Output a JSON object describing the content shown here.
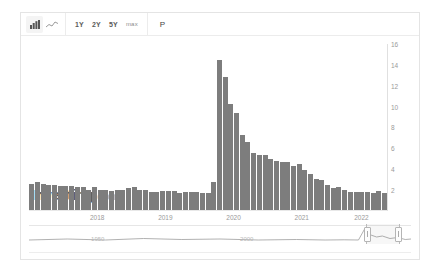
{
  "toolbar": {
    "chart_type_icons": [
      {
        "name": "bar-chart-icon",
        "label": "Bar chart",
        "active": true
      },
      {
        "name": "line-chart-icon",
        "label": "Line chart",
        "active": false
      }
    ],
    "ranges": [
      {
        "label": "1Y"
      },
      {
        "label": "2Y"
      },
      {
        "label": "5Y"
      },
      {
        "label": "max"
      }
    ],
    "print_label": "P"
  },
  "chart_data": {
    "type": "bar",
    "title": "",
    "xlabel": "",
    "ylabel": "",
    "ylim": [
      2,
      16
    ],
    "grid": false,
    "legend": null,
    "bar_color": "#7d7d7d",
    "ytick_labels": [
      "16",
      "14",
      "12",
      "10",
      "8",
      "6",
      "4",
      "2"
    ],
    "ytick_values": [
      16,
      14,
      12,
      10,
      8,
      6,
      4,
      2
    ],
    "xtick_labels": [
      "2018",
      "2019",
      "2020",
      "2021",
      "2022"
    ],
    "xtick_values": [
      2018,
      2019,
      2020,
      2021,
      2022
    ],
    "categories": [
      "2017-07",
      "2017-08",
      "2017-09",
      "2017-10",
      "2017-11",
      "2017-12",
      "2018-01",
      "2018-02",
      "2018-03",
      "2018-04",
      "2018-05",
      "2018-06",
      "2018-07",
      "2018-08",
      "2018-09",
      "2018-10",
      "2018-11",
      "2018-12",
      "2019-01",
      "2019-02",
      "2019-03",
      "2019-04",
      "2019-05",
      "2019-06",
      "2019-07",
      "2019-08",
      "2019-09",
      "2019-10",
      "2019-11",
      "2019-12",
      "2020-01",
      "2020-02",
      "2020-03",
      "2020-04",
      "2020-05",
      "2020-06",
      "2020-07",
      "2020-08",
      "2020-09",
      "2020-10",
      "2020-11",
      "2020-12",
      "2021-01",
      "2021-02",
      "2021-03",
      "2021-04",
      "2021-05",
      "2021-06",
      "2021-07",
      "2021-08",
      "2021-09",
      "2021-10",
      "2021-11",
      "2021-12",
      "2022-01",
      "2022-02",
      "2022-03",
      "2022-04",
      "2022-05",
      "2022-06",
      "2022-07",
      "2022-08",
      "2022-09"
    ],
    "values": [
      4.3,
      4.4,
      4.3,
      4.2,
      4.2,
      4.1,
      4.1,
      4.1,
      4.0,
      4.0,
      3.8,
      4.0,
      3.8,
      3.8,
      3.7,
      3.8,
      3.8,
      3.9,
      4.0,
      3.8,
      3.8,
      3.6,
      3.6,
      3.7,
      3.7,
      3.7,
      3.5,
      3.6,
      3.6,
      3.6,
      3.5,
      3.5,
      4.4,
      14.7,
      13.2,
      11.0,
      10.2,
      8.4,
      7.8,
      6.9,
      6.7,
      6.7,
      6.4,
      6.2,
      6.1,
      6.1,
      5.8,
      5.9,
      5.4,
      5.1,
      4.7,
      4.6,
      4.2,
      3.9,
      4.0,
      3.8,
      3.6,
      3.6,
      3.6,
      3.6,
      3.5,
      3.7,
      3.5
    ]
  },
  "watermark": {
    "name": "Investing",
    "suffix": ".com"
  },
  "navigator": {
    "ticks": [
      {
        "label": "1950",
        "pos": 18
      },
      {
        "label": "2000",
        "pos": 57
      }
    ]
  }
}
